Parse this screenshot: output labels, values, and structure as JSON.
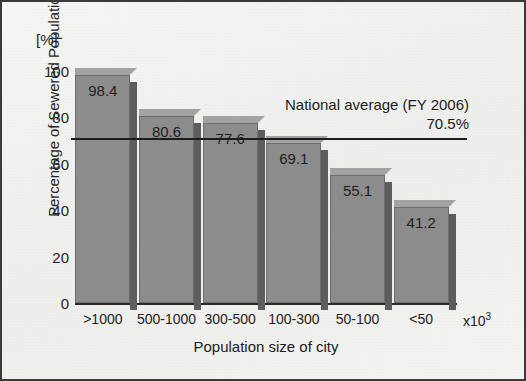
{
  "chart_data": {
    "type": "bar",
    "title": "",
    "xlabel": "Population size of city",
    "ylabel": "Percentage of Sewered Population",
    "yunit": "[%]",
    "xunit_prefix": "x10",
    "xunit_exponent": "3",
    "categories": [
      ">1000",
      "500-1000",
      "300-500",
      "100-300",
      "50-100",
      "<50"
    ],
    "values": [
      98.4,
      80.6,
      77.6,
      69.1,
      55.1,
      41.2
    ],
    "value_labels": [
      "98.4",
      "80.6",
      "77.6",
      "69.1",
      "55.1",
      "41.2"
    ],
    "ylim": [
      0,
      100
    ],
    "ytick_labels": [
      "0",
      "20",
      "40",
      "60",
      "80",
      "100"
    ],
    "ytick_values": [
      0,
      20,
      40,
      60,
      80,
      100
    ],
    "yminor_values": [
      10,
      30,
      50,
      70,
      90
    ],
    "grid": false,
    "legend": "none",
    "annotations": [
      {
        "name": "national-average",
        "line1": "National average (FY 2006)",
        "line2": "70.5%",
        "value": 70.5
      }
    ],
    "colors": {
      "bar_face": "#8c8c8c",
      "bar_top": "#a3a3a3",
      "bar_side": "#5d5d5d",
      "axis": "#2b2b2b",
      "average_line": "#1c1c1c",
      "background": "#f0f0ee",
      "border": "#3a3a3a"
    }
  }
}
